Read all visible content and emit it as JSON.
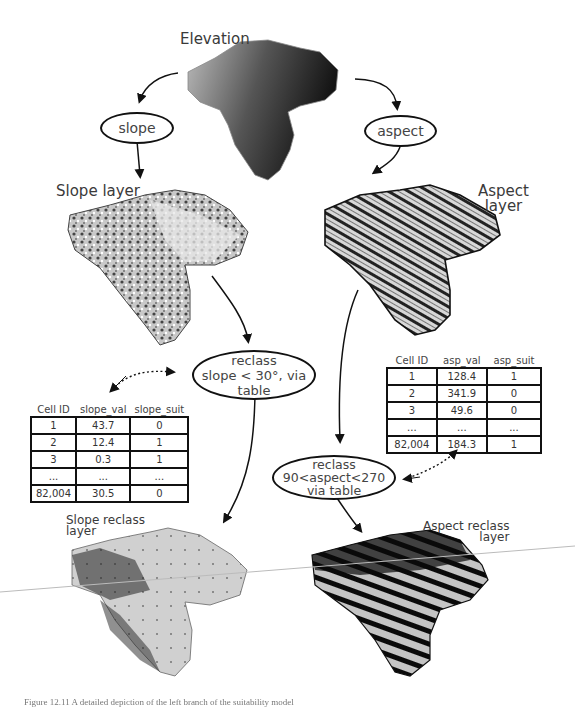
{
  "title": "Elevation",
  "operations": {
    "slope": "slope",
    "aspect": "aspect"
  },
  "layers": {
    "slope": "Slope layer",
    "aspect_line1": "Aspect",
    "aspect_line2": "layer",
    "slope_reclass_line1": "Slope reclass",
    "slope_reclass_line2": "layer",
    "aspect_reclass_line1": "Aspect reclass",
    "aspect_reclass_line2": "layer"
  },
  "reclass_slope": {
    "line1": "reclass",
    "line2": "slope < 30°, via",
    "line3": "table"
  },
  "reclass_aspect": {
    "line1": "reclass",
    "line2": "90<aspect<270",
    "line3": "via table"
  },
  "slope_table": {
    "headers": [
      "Cell ID",
      "slope_val",
      "slope_suit"
    ],
    "rows": [
      [
        "1",
        "43.7",
        "0"
      ],
      [
        "2",
        "12.4",
        "1"
      ],
      [
        "3",
        "0.3",
        "1"
      ],
      [
        "...",
        "...",
        "..."
      ],
      [
        "82,004",
        "30.5",
        "0"
      ]
    ]
  },
  "aspect_table": {
    "headers": [
      "Cell ID",
      "asp_val",
      "asp_suit"
    ],
    "rows": [
      [
        "1",
        "128.4",
        "1"
      ],
      [
        "2",
        "341.9",
        "0"
      ],
      [
        "3",
        "49.6",
        "0"
      ],
      [
        "...",
        "...",
        "..."
      ],
      [
        "82,004",
        "184.3",
        "1"
      ]
    ]
  },
  "caption": "Figure 12.11 A detailed depiction of the left branch of the suitability model"
}
